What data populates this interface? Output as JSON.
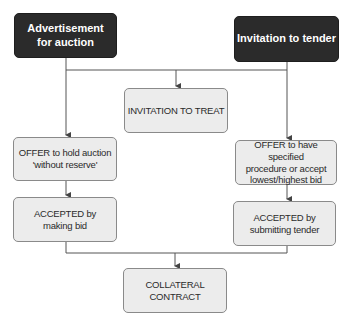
{
  "diagram": {
    "nodes": {
      "advertisement": {
        "label": "Advertisement for auction",
        "line1": "Advertisement",
        "line2": "for auction"
      },
      "invitation_tender": {
        "label": "Invitation to tender"
      },
      "invitation_treat": {
        "label": "INVITATION TO TREAT"
      },
      "offer_auction": {
        "line1": "OFFER to hold auction",
        "line2": "'without reserve'"
      },
      "accepted_bid": {
        "line1": "ACCEPTED by",
        "line2": "making bid"
      },
      "offer_tender": {
        "line1": "OFFER to have specified",
        "line2": "procedure or accept",
        "line3": "lowest/highest bid"
      },
      "accepted_tender": {
        "line1": "ACCEPTED by",
        "line2": "submitting tender"
      },
      "collateral": {
        "line1": "COLLATERAL",
        "line2": "CONTRACT"
      }
    },
    "edges": [
      [
        "advertisement",
        "invitation_treat"
      ],
      [
        "invitation_tender",
        "invitation_treat"
      ],
      [
        "advertisement",
        "offer_auction"
      ],
      [
        "invitation_tender",
        "offer_tender"
      ],
      [
        "offer_auction",
        "accepted_bid"
      ],
      [
        "offer_tender",
        "accepted_tender"
      ],
      [
        "accepted_bid",
        "collateral"
      ],
      [
        "accepted_tender",
        "collateral"
      ]
    ],
    "colors": {
      "dark_box": "#2b2b2b",
      "light_box": "#ececec",
      "line": "#555555"
    }
  }
}
